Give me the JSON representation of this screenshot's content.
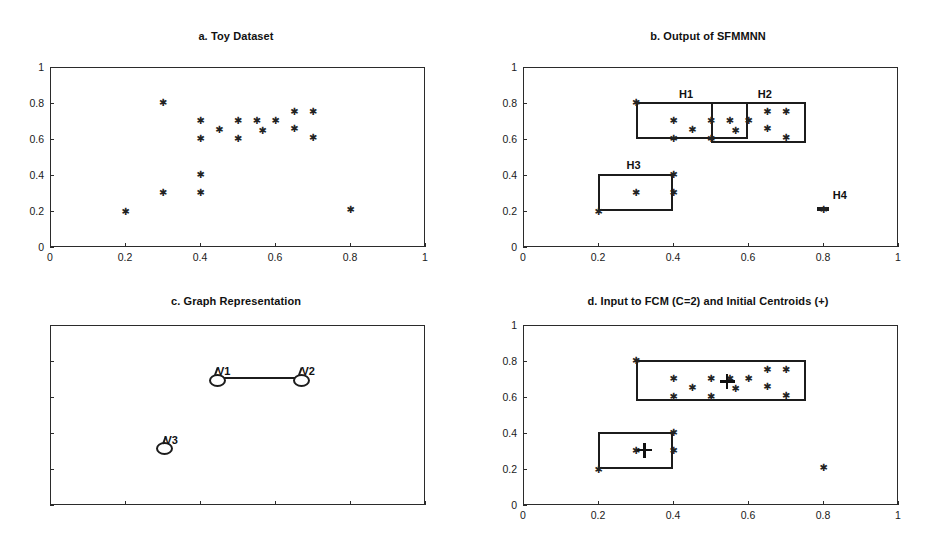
{
  "figure": {
    "width": 944,
    "height": 558,
    "background": "#ffffff",
    "ink": "#1c1c1c"
  },
  "chart_data": [
    {
      "id": "panel_a",
      "type": "scatter",
      "title": "a. Toy Dataset",
      "xlabel": "",
      "ylabel": "",
      "xlim": [
        0,
        1
      ],
      "ylim": [
        0,
        1
      ],
      "xticks": [
        0,
        0.2,
        0.4,
        0.6,
        0.8,
        1
      ],
      "yticks": [
        0,
        0.2,
        0.4,
        0.6,
        0.8,
        1
      ],
      "xticklabels": [
        "0",
        "0.2",
        "0.4",
        "0.6",
        "0.8",
        "1"
      ],
      "yticklabels": [
        "0",
        "0.2",
        "0.4",
        "0.6",
        "0.8",
        "1"
      ],
      "grid": false,
      "legend": false,
      "marker": "asterisk",
      "series": [
        {
          "name": "toy points",
          "points": [
            [
              0.2,
              0.2
            ],
            [
              0.3,
              0.805
            ],
            [
              0.3,
              0.305
            ],
            [
              0.4,
              0.705
            ],
            [
              0.4,
              0.605
            ],
            [
              0.4,
              0.405
            ],
            [
              0.4,
              0.305
            ],
            [
              0.45,
              0.655
            ],
            [
              0.5,
              0.705
            ],
            [
              0.5,
              0.605
            ],
            [
              0.55,
              0.705
            ],
            [
              0.565,
              0.65
            ],
            [
              0.6,
              0.705
            ],
            [
              0.65,
              0.755
            ],
            [
              0.65,
              0.66
            ],
            [
              0.7,
              0.755
            ],
            [
              0.7,
              0.61
            ],
            [
              0.8,
              0.21
            ]
          ]
        }
      ]
    },
    {
      "id": "panel_b",
      "type": "scatter",
      "title": "b. Output of SFMMNN",
      "xlabel": "",
      "ylabel": "",
      "xlim": [
        0,
        1
      ],
      "ylim": [
        0,
        1
      ],
      "xticks": [
        0,
        0.2,
        0.4,
        0.6,
        0.8,
        1
      ],
      "yticks": [
        0,
        0.2,
        0.4,
        0.6,
        0.8,
        1
      ],
      "xticklabels": [
        "0",
        "0.2",
        "0.4",
        "0.6",
        "0.8",
        "1"
      ],
      "yticklabels": [
        "0",
        "0.2",
        "0.4",
        "0.6",
        "0.8",
        "1"
      ],
      "grid": false,
      "legend": false,
      "marker": "asterisk",
      "series": [
        {
          "name": "toy points",
          "points": [
            [
              0.2,
              0.2
            ],
            [
              0.3,
              0.805
            ],
            [
              0.3,
              0.305
            ],
            [
              0.4,
              0.705
            ],
            [
              0.4,
              0.605
            ],
            [
              0.4,
              0.405
            ],
            [
              0.4,
              0.305
            ],
            [
              0.45,
              0.655
            ],
            [
              0.5,
              0.705
            ],
            [
              0.5,
              0.605
            ],
            [
              0.55,
              0.705
            ],
            [
              0.565,
              0.65
            ],
            [
              0.6,
              0.705
            ],
            [
              0.65,
              0.755
            ],
            [
              0.65,
              0.66
            ],
            [
              0.7,
              0.755
            ],
            [
              0.7,
              0.61
            ],
            [
              0.8,
              0.21
            ]
          ]
        }
      ],
      "hyperboxes": [
        {
          "label": "H1",
          "x0": 0.3,
          "y0": 0.6,
          "x1": 0.6,
          "y1": 0.805,
          "label_x": 0.435,
          "label_y": 0.885
        },
        {
          "label": "H2",
          "x0": 0.5,
          "y0": 0.578,
          "x1": 0.755,
          "y1": 0.805,
          "label_x": 0.645,
          "label_y": 0.885
        },
        {
          "label": "H3",
          "x0": 0.2,
          "y0": 0.2,
          "x1": 0.4,
          "y1": 0.405,
          "label_x": 0.295,
          "label_y": 0.487
        },
        {
          "label": "H4",
          "x0": 0.785,
          "y0": 0.198,
          "x1": 0.815,
          "y1": 0.224,
          "label_x": 0.845,
          "label_y": 0.325
        }
      ]
    },
    {
      "id": "panel_c",
      "type": "graph",
      "title": "c. Graph Representation",
      "xlabel": "",
      "ylabel": "",
      "xlim": [
        0,
        1
      ],
      "ylim": [
        0,
        1
      ],
      "xticks": [
        0,
        0.2,
        0.4,
        0.6,
        0.8,
        1
      ],
      "yticks": [
        0,
        0.2,
        0.4,
        0.6,
        0.8,
        1
      ],
      "xticklabels": [
        "",
        "",
        "",
        "",
        "",
        ""
      ],
      "yticklabels": [
        "",
        "",
        "",
        "",
        "",
        ""
      ],
      "grid": false,
      "legend": false,
      "nodes": [
        {
          "label": "V1",
          "x": 0.44,
          "y": 0.705
        },
        {
          "label": "V2",
          "x": 0.665,
          "y": 0.705
        },
        {
          "label": "V3",
          "x": 0.3,
          "y": 0.325
        }
      ],
      "edges": [
        {
          "from": "V1",
          "to": "V2"
        }
      ]
    },
    {
      "id": "panel_d",
      "type": "scatter",
      "title": "d. Input to FCM (C=2) and Initial Centroids (+)",
      "xlabel": "",
      "ylabel": "",
      "xlim": [
        0,
        1
      ],
      "ylim": [
        0,
        1
      ],
      "xticks": [
        0,
        0.2,
        0.4,
        0.6,
        0.8,
        1
      ],
      "yticks": [
        0,
        0.2,
        0.4,
        0.6,
        0.8,
        1
      ],
      "xticklabels": [
        "0",
        "0.2",
        "0.4",
        "0.6",
        "0.8",
        "1"
      ],
      "yticklabels": [
        "0",
        "0.2",
        "0.4",
        "0.6",
        "0.8",
        "1"
      ],
      "grid": false,
      "legend": false,
      "marker": "asterisk",
      "series": [
        {
          "name": "toy points",
          "points": [
            [
              0.2,
              0.2
            ],
            [
              0.3,
              0.805
            ],
            [
              0.3,
              0.305
            ],
            [
              0.4,
              0.705
            ],
            [
              0.4,
              0.605
            ],
            [
              0.4,
              0.405
            ],
            [
              0.4,
              0.305
            ],
            [
              0.45,
              0.655
            ],
            [
              0.5,
              0.705
            ],
            [
              0.5,
              0.605
            ],
            [
              0.55,
              0.705
            ],
            [
              0.565,
              0.65
            ],
            [
              0.6,
              0.705
            ],
            [
              0.65,
              0.755
            ],
            [
              0.65,
              0.66
            ],
            [
              0.7,
              0.755
            ],
            [
              0.7,
              0.61
            ],
            [
              0.8,
              0.21
            ]
          ]
        }
      ],
      "hyperboxes": [
        {
          "label": "",
          "x0": 0.3,
          "y0": 0.578,
          "x1": 0.755,
          "y1": 0.805
        },
        {
          "label": "",
          "x0": 0.2,
          "y0": 0.2,
          "x1": 0.4,
          "y1": 0.405
        }
      ],
      "centroids": {
        "marker": "plus",
        "points": [
          [
            0.545,
            0.685
          ],
          [
            0.325,
            0.305
          ]
        ]
      }
    }
  ]
}
